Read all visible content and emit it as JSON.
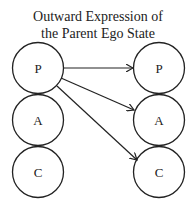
{
  "title": {
    "line1": "Outward Expression of",
    "line2": "the Parent Ego State"
  },
  "diagram": {
    "left_states": [
      {
        "label": "P",
        "cx": 38,
        "cy": 68
      },
      {
        "label": "A",
        "cx": 38,
        "cy": 120
      },
      {
        "label": "C",
        "cx": 38,
        "cy": 172
      }
    ],
    "right_states": [
      {
        "label": "P",
        "cx": 159,
        "cy": 68
      },
      {
        "label": "A",
        "cx": 159,
        "cy": 120
      },
      {
        "label": "C",
        "cx": 159,
        "cy": 172
      }
    ],
    "arrows": [
      {
        "from": "left.P",
        "to": "right.P"
      },
      {
        "from": "left.P",
        "to": "right.A"
      },
      {
        "from": "left.P",
        "to": "right.C"
      }
    ],
    "stroke_color": "#222222"
  }
}
